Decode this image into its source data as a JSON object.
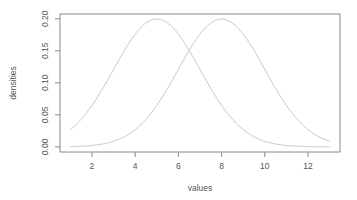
{
  "chart_data": {
    "type": "line",
    "title": "",
    "xlabel": "values",
    "ylabel": "densities",
    "xlim": [
      1,
      13
    ],
    "ylim": [
      0,
      0.2
    ],
    "x_ticks": [
      2,
      4,
      6,
      8,
      10,
      12
    ],
    "x_tick_labels": [
      "2",
      "4",
      "6",
      "8",
      "10",
      "12"
    ],
    "y_ticks": [
      0.0,
      0.05,
      0.1,
      0.15,
      0.2
    ],
    "y_tick_labels": [
      "0.00",
      "0.05",
      "0.10",
      "0.15",
      "0.20"
    ],
    "grid": false,
    "legend": null,
    "series": [
      {
        "name": "normal density, mean 5, sd 2",
        "distribution": {
          "mean": 5,
          "sd": 2
        },
        "x": [
          1,
          2,
          3,
          4,
          5,
          6,
          7,
          8,
          9,
          10,
          11,
          12,
          13
        ],
        "values": [
          0.027,
          0.065,
          0.121,
          0.176,
          0.199,
          0.176,
          0.121,
          0.065,
          0.027,
          0.009,
          0.002,
          0.0004,
          0.0001
        ],
        "color": "#c8c8c8"
      },
      {
        "name": "normal density, mean 8, sd 2",
        "distribution": {
          "mean": 8,
          "sd": 2
        },
        "x": [
          1,
          2,
          3,
          4,
          5,
          6,
          7,
          8,
          9,
          10,
          11,
          12,
          13
        ],
        "values": [
          0.0004,
          0.002,
          0.009,
          0.027,
          0.065,
          0.121,
          0.176,
          0.199,
          0.176,
          0.121,
          0.065,
          0.027,
          0.009
        ],
        "color": "#c8c8c8"
      }
    ],
    "colors": {
      "axis": "#8a8a8a",
      "text": "#555555",
      "curve": "#c8c8c8",
      "background": "#ffffff"
    }
  }
}
